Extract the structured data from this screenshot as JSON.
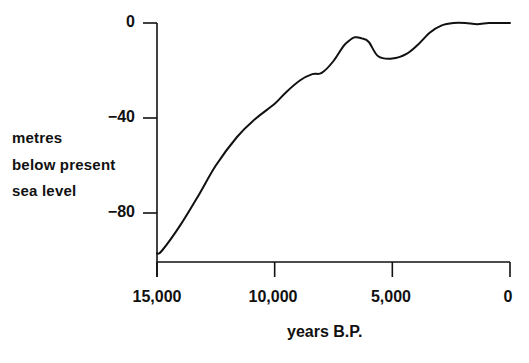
{
  "chart_data": {
    "type": "line",
    "title": "",
    "xlabel": "years B.P.",
    "ylabel": "metres below present sea level",
    "ylabel_lines": [
      "metres",
      "below present",
      "sea level"
    ],
    "x_ticks": [
      "15,000",
      "10,000",
      "5,000",
      "0"
    ],
    "x_tick_values": [
      15000,
      10000,
      5000,
      0
    ],
    "y_ticks": [
      "0",
      "−40",
      "−80"
    ],
    "y_tick_values": [
      0,
      -40,
      -80
    ],
    "xlim": [
      15000,
      0
    ],
    "ylim": [
      -100,
      0
    ],
    "x_reversed": true,
    "grid": false,
    "legend": null,
    "series": [
      {
        "name": "sea level",
        "color": "#111111",
        "x": [
          15000,
          14800,
          14000,
          13200,
          12500,
          11600,
          10900,
          10000,
          9500,
          8900,
          8400,
          8000,
          7500,
          7100,
          6900,
          6600,
          6300,
          6000,
          5600,
          5000,
          4400,
          3900,
          3400,
          2900,
          2400,
          1900,
          1400,
          900,
          400,
          0
        ],
        "values": [
          -97,
          -96,
          -85,
          -72,
          -60,
          -48,
          -41,
          -34,
          -29,
          -24,
          -21.5,
          -21,
          -16,
          -10,
          -8,
          -6,
          -6.5,
          -8,
          -14,
          -15,
          -13,
          -9,
          -4,
          -1,
          0,
          0,
          -0.5,
          0,
          0,
          0
        ]
      }
    ]
  }
}
